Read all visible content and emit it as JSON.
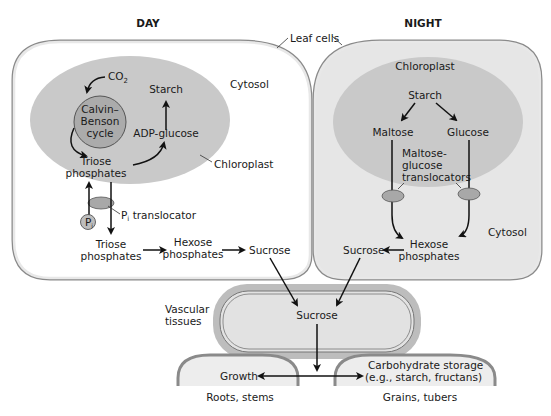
{
  "panels": {
    "day": {
      "title": "DAY",
      "cytosol": "Cytosol",
      "chloroplast": "Chloroplast",
      "co2": "CO",
      "co2_sub": "2",
      "calvin": [
        "Calvin–",
        "Benson",
        "cycle"
      ],
      "starch": "Starch",
      "adp_glucose": "ADP-glucose",
      "triose_in": [
        "Triose",
        "phosphates"
      ],
      "pi": "P",
      "pi_sub": "i",
      "pi_translocator": "P",
      "pi_translocator_sub": "i",
      "pi_translocator_rest": " translocator",
      "triose_out": [
        "Triose",
        "phosphates"
      ],
      "hexose": [
        "Hexose",
        "phosphates"
      ],
      "sucrose": "Sucrose"
    },
    "night": {
      "title": "NIGHT",
      "chloroplast": "Chloroplast",
      "starch": "Starch",
      "maltose": "Maltose",
      "glucose": "Glucose",
      "translocators": [
        "Maltose-",
        "glucose",
        "translocators"
      ],
      "cytosol": "Cytosol",
      "hexose": [
        "Hexose",
        "phosphates"
      ],
      "sucrose": "Sucrose"
    }
  },
  "leaf_cells_label": "Leaf cells",
  "vascular": {
    "label": [
      "Vascular",
      "tissues"
    ],
    "sucrose": "Sucrose"
  },
  "sinks": {
    "growth": "Growth",
    "roots_label": "Roots, stems",
    "storage": [
      "Carbohydrate storage",
      "(e.g., starch, fructans)"
    ],
    "grains_label": "Grains, tubers"
  },
  "colors": {
    "cell_wall": "#9a9a9a",
    "cell_fill_day": "#ffffff",
    "cell_fill_night": "#e6e6e6",
    "chloroplast": "#c8c8c8",
    "calvin": "#b0b0b0",
    "translocator": "#a8a8a8",
    "vascular_outer": "#b8b8b8",
    "vascular_inner": "#e2e2e2",
    "sink_fill": "#ededed"
  }
}
